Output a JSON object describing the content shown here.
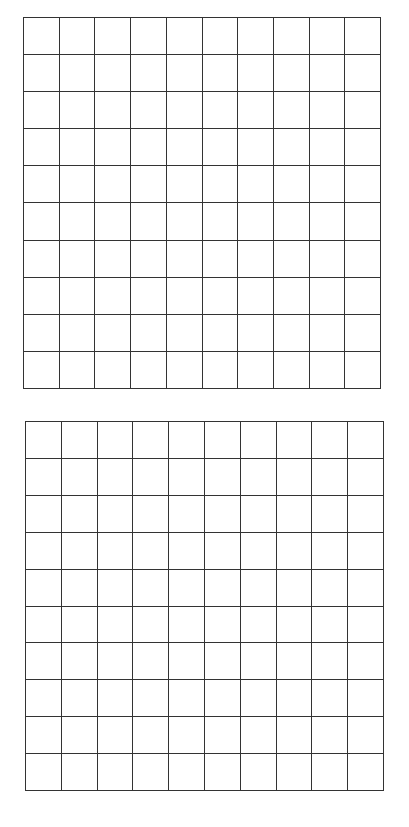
{
  "grids": [
    {
      "name": "top-grid",
      "rows": 10,
      "cols": 10,
      "left": 23,
      "top": 17,
      "width": 358,
      "height": 372
    },
    {
      "name": "bottom-grid",
      "rows": 10,
      "cols": 10,
      "left": 25,
      "top": 421,
      "width": 359,
      "height": 370
    }
  ],
  "line_color": "#333333",
  "background": "#ffffff"
}
